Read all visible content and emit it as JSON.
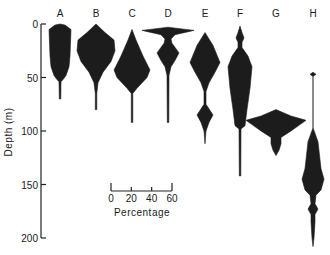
{
  "chart_data": {
    "type": "kite",
    "title": "",
    "ylabel": "Depth (m)",
    "xlabel": "",
    "ylim": [
      0,
      200
    ],
    "y_inverted": true,
    "yticks": [
      0,
      50,
      100,
      150,
      200
    ],
    "grid": false,
    "scale_bar": {
      "label": "Percentage",
      "ticks": [
        0,
        20,
        40,
        60
      ]
    },
    "series": [
      {
        "name": "A",
        "profile": [
          [
            0,
            0
          ],
          [
            1,
            10
          ],
          [
            5,
            22
          ],
          [
            30,
            20
          ],
          [
            40,
            18
          ],
          [
            48,
            12
          ],
          [
            52,
            6
          ],
          [
            54,
            2
          ],
          [
            70,
            1.5
          ],
          [
            70,
            0
          ]
        ]
      },
      {
        "name": "B",
        "profile": [
          [
            0,
            0
          ],
          [
            8,
            18
          ],
          [
            15,
            36
          ],
          [
            25,
            38
          ],
          [
            35,
            30
          ],
          [
            45,
            14
          ],
          [
            55,
            4
          ],
          [
            65,
            1.5
          ],
          [
            80,
            1.5
          ],
          [
            80,
            0
          ]
        ]
      },
      {
        "name": "C",
        "profile": [
          [
            5,
            0
          ],
          [
            15,
            8
          ],
          [
            30,
            22
          ],
          [
            43,
            36
          ],
          [
            50,
            30
          ],
          [
            60,
            10
          ],
          [
            65,
            1.5
          ],
          [
            92,
            1.5
          ],
          [
            92,
            0
          ]
        ]
      },
      {
        "name": "D",
        "profile": [
          [
            3,
            0
          ],
          [
            6,
            52
          ],
          [
            10,
            14
          ],
          [
            14,
            6
          ],
          [
            18,
            8
          ],
          [
            27,
            22
          ],
          [
            34,
            14
          ],
          [
            40,
            6
          ],
          [
            48,
            2
          ],
          [
            92,
            1.5
          ],
          [
            92,
            0
          ]
        ]
      },
      {
        "name": "E",
        "profile": [
          [
            8,
            0
          ],
          [
            20,
            16
          ],
          [
            36,
            30
          ],
          [
            45,
            20
          ],
          [
            55,
            8
          ],
          [
            63,
            2
          ],
          [
            75,
            2
          ],
          [
            85,
            16
          ],
          [
            92,
            8
          ],
          [
            100,
            2
          ],
          [
            112,
            0
          ]
        ]
      },
      {
        "name": "F",
        "profile": [
          [
            2,
            0
          ],
          [
            8,
            4
          ],
          [
            13,
            8
          ],
          [
            17,
            4
          ],
          [
            22,
            4
          ],
          [
            30,
            16
          ],
          [
            40,
            24
          ],
          [
            60,
            20
          ],
          [
            80,
            14
          ],
          [
            95,
            10
          ],
          [
            98,
            2
          ],
          [
            142,
            1.5
          ],
          [
            142,
            0
          ]
        ]
      },
      {
        "name": "G",
        "profile": [
          [
            80,
            0
          ],
          [
            86,
            30
          ],
          [
            90,
            60
          ],
          [
            100,
            30
          ],
          [
            106,
            10
          ],
          [
            112,
            10
          ],
          [
            118,
            6
          ],
          [
            123,
            0
          ]
        ]
      },
      {
        "name": "H",
        "profile": [
          [
            45,
            0
          ],
          [
            47,
            6
          ],
          [
            49,
            0
          ],
          [
            97,
            0
          ],
          [
            110,
            10
          ],
          [
            135,
            16
          ],
          [
            145,
            22
          ],
          [
            155,
            16
          ],
          [
            160,
            6
          ],
          [
            168,
            4
          ],
          [
            173,
            10
          ],
          [
            178,
            4
          ],
          [
            185,
            4
          ],
          [
            200,
            2
          ],
          [
            208,
            0
          ]
        ]
      }
    ]
  }
}
